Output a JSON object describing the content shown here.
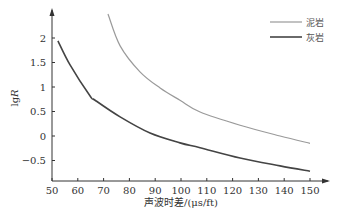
{
  "chart_data": {
    "type": "line",
    "title": "",
    "xlabel": "声波时差/(μs/ft)",
    "ylabel": "lgR",
    "xlim": [
      50,
      155
    ],
    "ylim": [
      -0.85,
      2.5
    ],
    "x_ticks": [
      50,
      60,
      70,
      80,
      90,
      100,
      110,
      120,
      130,
      140,
      150
    ],
    "y_ticks": [
      -0.5,
      0,
      0.5,
      1,
      1.5,
      2
    ],
    "y_tick_labels": [
      "−0.5",
      "0",
      "0.5",
      "1",
      "1.5",
      "2"
    ],
    "grid": false,
    "legend_position": "top-right",
    "series": [
      {
        "name": "泥岩",
        "color": "#9a9a9a",
        "x": [
          71.7,
          76.4,
          84.1,
          91.9,
          99.6,
          107.4,
          122.9,
          138.4,
          150
        ],
        "y": [
          2.49,
          1.84,
          1.31,
          0.98,
          0.73,
          0.49,
          0.22,
          0.0,
          -0.15
        ]
      },
      {
        "name": "灰岩",
        "color": "#444444",
        "x": [
          52.3,
          57.0,
          64.7,
          66.7,
          76.4,
          88.0,
          99.6,
          107.4,
          122.9,
          138.4,
          150
        ],
        "y": [
          1.94,
          1.45,
          0.82,
          0.73,
          0.39,
          0.06,
          -0.14,
          -0.24,
          -0.45,
          -0.61,
          -0.72
        ]
      }
    ]
  }
}
